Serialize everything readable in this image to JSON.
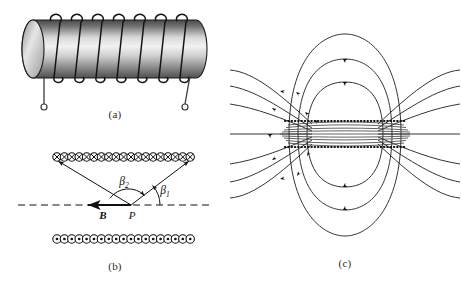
{
  "figure": {
    "title_visible": false,
    "background_color": "#ffffff",
    "ink_color": "#1a1a1a",
    "panels": [
      {
        "id": "a",
        "caption": "(a)",
        "description": "Pictorial view of a helical solenoid coil wound on a shaded cylinder with two lead wires ending in open circular terminals",
        "cylinder": {
          "turns": 8,
          "lead_terminals": 2,
          "shading": "cylindrical gray gradient"
        }
      },
      {
        "id": "b",
        "caption": "(b)",
        "description": "Cross-sectional view of the solenoid showing current into the page on the top row and out of the page on the bottom row, with field point P on the axis",
        "top_row": {
          "symbol": "cross-in-circle",
          "symbol_unicode": "⊗",
          "meaning": "current into page",
          "count": 19
        },
        "bottom_row": {
          "symbol": "dot-in-circle",
          "symbol_unicode": "⊙",
          "meaning": "current out of page",
          "count": 19
        },
        "axis": {
          "style": "dashed",
          "label": ""
        },
        "labels": {
          "field_point": "P",
          "field_vector": "B",
          "angle_1": "β",
          "angle_1_sub": "1",
          "angle_2": "β",
          "angle_2_sub": "2"
        }
      },
      {
        "id": "c",
        "caption": "(c)",
        "description": "Magnetic field line map of a finite solenoid: dense straight lines inside, looping return flux outside, with arrowheads showing field direction and dotted lines marking the coil windings",
        "field_lines": {
          "outer_loops": 3,
          "flared_lines": 8,
          "interior_lines": 9,
          "arrowheads": 14
        },
        "coil_rows": {
          "style": "dotted",
          "count": 2
        }
      }
    ]
  }
}
